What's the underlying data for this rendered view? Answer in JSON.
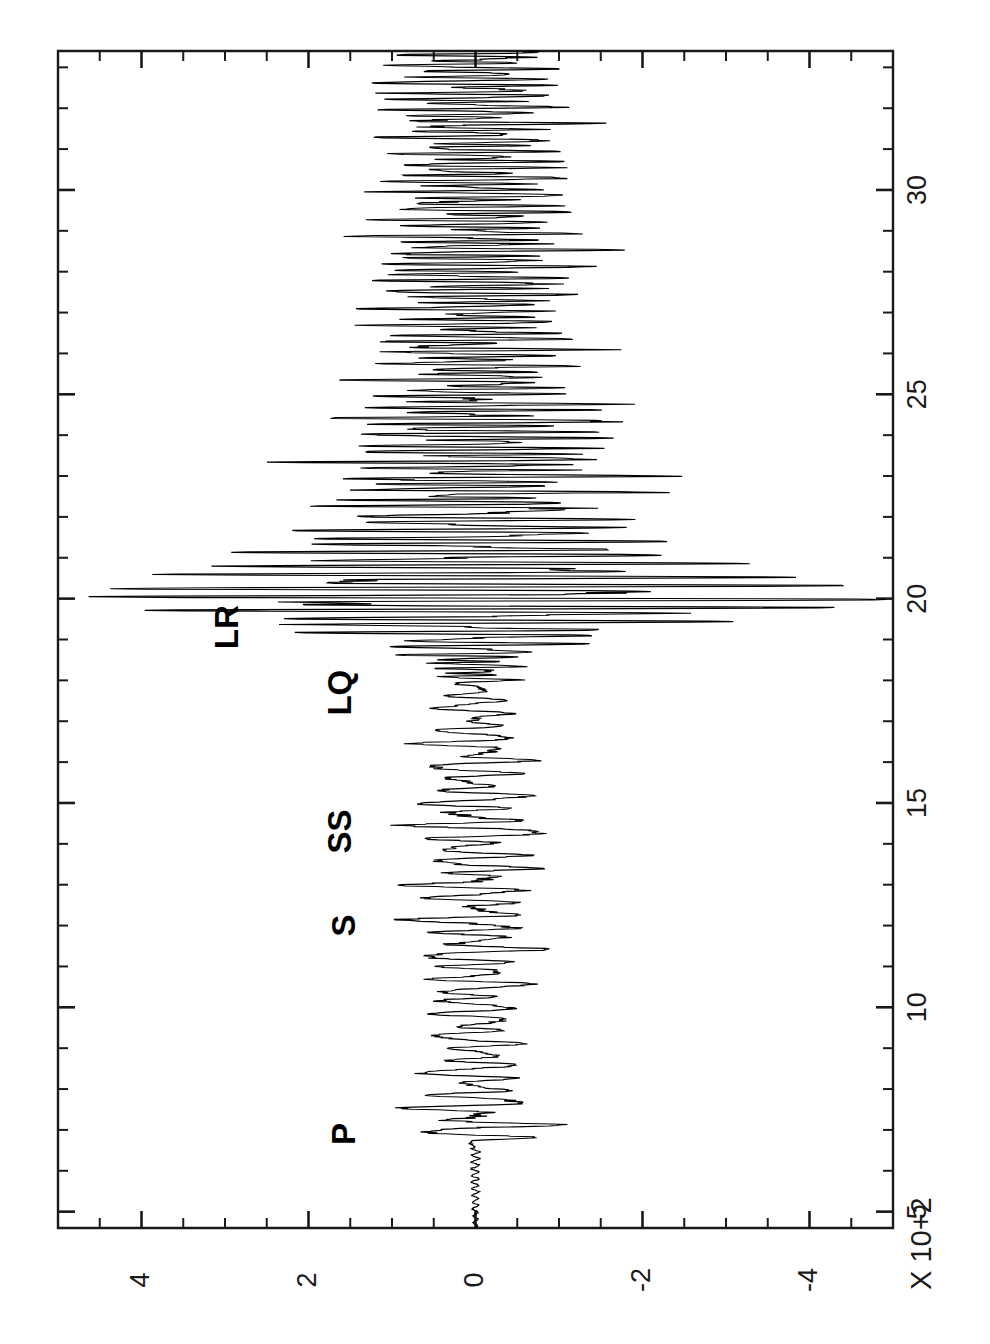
{
  "figure": {
    "orientation": "rotated-90",
    "background_color": "#ffffff",
    "ink_color": "#000000"
  },
  "axes": {
    "time_axis": {
      "label": "X 10+2",
      "unit_multiplier": "X 10+2",
      "major_ticks": [
        5,
        10,
        15,
        20,
        25,
        30
      ],
      "major_tick_labels": [
        "5",
        "10",
        "15",
        "20",
        "25",
        "30"
      ],
      "minor_tick_step": 1,
      "range": [
        4.6,
        33.4
      ],
      "orientation": "vertical-up"
    },
    "amplitude_axis": {
      "label": "",
      "major_ticks": [
        4,
        2,
        0,
        -2,
        -4
      ],
      "major_tick_labels": [
        "4",
        "2",
        "0",
        "-2",
        "-4"
      ],
      "minor_tick_step": 0.5,
      "range": [
        5.0,
        -5.0
      ],
      "orientation": "horizontal"
    }
  },
  "phase_labels": [
    {
      "name": "P",
      "text": "P",
      "time": 6.9,
      "amplitude_side": "positive"
    },
    {
      "name": "S",
      "text": "S",
      "time": 12.0,
      "amplitude_side": "positive"
    },
    {
      "name": "SS",
      "text": "SS",
      "time": 14.3,
      "amplitude_side": "positive"
    },
    {
      "name": "LQ",
      "text": "LQ",
      "time": 17.7,
      "amplitude_side": "positive"
    },
    {
      "name": "LR",
      "text": "LR",
      "time": 19.3,
      "amplitude_side": "positive"
    }
  ],
  "chart_data": {
    "type": "line",
    "title": "",
    "subtitle": "",
    "xlabel": "X 10+2",
    "ylabel": "",
    "xlim": [
      4.6,
      33.4
    ],
    "ylim": [
      -5.0,
      5.0
    ],
    "grid": false,
    "legend": null,
    "series_name": "seismogram-trace",
    "envelope_breakpoints": {
      "comment": "peak amplitude (absolute, axis units) versus time (x10+2 s)",
      "time": [
        4.6,
        6.5,
        6.7,
        6.9,
        7.4,
        8.2,
        9.2,
        10.2,
        11.0,
        11.8,
        12.5,
        13.2,
        13.8,
        14.3,
        15.0,
        15.6,
        16.3,
        16.8,
        17.3,
        17.8,
        18.3,
        18.8,
        19.2,
        19.6,
        19.9,
        20.2,
        20.6,
        21.0,
        21.5,
        22.0,
        22.6,
        23.2,
        23.8,
        24.4,
        25.0,
        25.6,
        26.2,
        26.8,
        27.4,
        28.0,
        28.6,
        29.2,
        29.8,
        30.4,
        31.0,
        31.6,
        32.2,
        32.8,
        33.4
      ],
      "amplitude": [
        0.03,
        0.06,
        0.1,
        0.95,
        0.8,
        0.62,
        0.55,
        0.62,
        0.7,
        0.78,
        0.72,
        0.85,
        0.6,
        0.95,
        0.7,
        0.58,
        0.85,
        0.52,
        0.48,
        0.42,
        0.55,
        0.95,
        1.85,
        3.1,
        4.55,
        4.25,
        3.35,
        2.55,
        1.95,
        1.55,
        1.85,
        2.05,
        1.6,
        1.95,
        1.35,
        1.15,
        1.55,
        1.1,
        1.25,
        1.35,
        1.45,
        1.3,
        1.15,
        1.2,
        1.05,
        1.25,
        1.1,
        1.15,
        0.95
      ]
    },
    "sample_count": 2400,
    "dominant_period_estimate": 0.22
  }
}
